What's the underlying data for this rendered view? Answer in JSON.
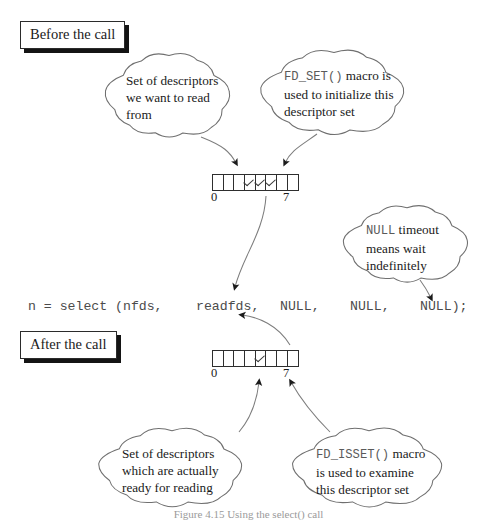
{
  "figure": {
    "caption": "Figure 4.15 Using the select() call",
    "colors": {
      "ink": "#1a1a1a",
      "stroke": "#2e2e2e",
      "code_gray": "#4b4b4b",
      "shadow": "#141414",
      "paper": "#ffffff"
    }
  },
  "labels": {
    "before": "Before the call",
    "after": "After the call"
  },
  "code_line": {
    "full": "n = select (nfds,     readfds,     NULL,     NULL,     NULL);",
    "tokens": [
      "n = select (nfds,",
      "readfds,",
      "NULL,",
      "NULL,",
      "NULL);"
    ]
  },
  "fd_sets": [
    {
      "id": "before-set",
      "cells": 8,
      "checked": [
        3,
        4,
        5
      ],
      "start_index": "0",
      "end_index": "7"
    },
    {
      "id": "after-set",
      "cells": 8,
      "checked": [
        4
      ],
      "start_index": "0",
      "end_index": "7"
    }
  ],
  "callouts": [
    {
      "id": "set-of-descriptors-read",
      "lines": [
        "Set of descriptors",
        "we want to read",
        "from"
      ],
      "mono_prefix": ""
    },
    {
      "id": "fd-set-macro",
      "lines": [
        "FD_SET() macro is",
        "used to initialize this",
        "descriptor set"
      ],
      "mono_prefix": "FD_SET()"
    },
    {
      "id": "null-timeout",
      "lines": [
        "NULL timeout",
        "means wait",
        "indefinitely"
      ],
      "mono_prefix": "NULL"
    },
    {
      "id": "ready-for-reading",
      "lines": [
        "Set of descriptors",
        "which are actually",
        "ready for reading"
      ],
      "mono_prefix": ""
    },
    {
      "id": "fd-isset-macro",
      "lines": [
        "FD_ISSET() macro",
        "is used to examine",
        "this descriptor set"
      ],
      "mono_prefix": "FD_ISSET()"
    }
  ]
}
